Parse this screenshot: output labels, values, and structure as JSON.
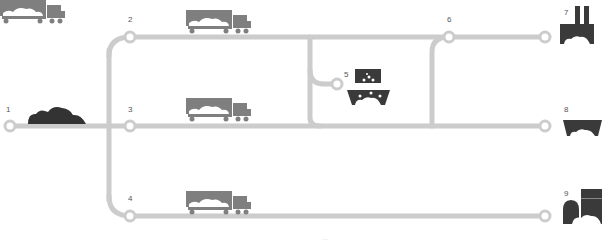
{
  "diagram": {
    "type": "flow",
    "colors": {
      "line": "#cccccc",
      "icon": "#3a3a3a",
      "truck": "#7f7f7f",
      "label": "#555555"
    },
    "nodes": [
      {
        "id": "1",
        "label": "1",
        "icon": "ore-pile-icon"
      },
      {
        "id": "2",
        "label": "2",
        "icon": "truck-icon"
      },
      {
        "id": "3",
        "label": "3",
        "icon": "truck-icon"
      },
      {
        "id": "4",
        "label": "4",
        "icon": "truck-icon"
      },
      {
        "id": "5",
        "label": "5",
        "icon": "washing-plant-icon"
      },
      {
        "id": "6",
        "label": "6"
      },
      {
        "id": "7",
        "label": "7",
        "icon": "factory-icon"
      },
      {
        "id": "8",
        "label": "8",
        "icon": "container-icon"
      },
      {
        "id": "9",
        "label": "9",
        "icon": "storage-plant-icon"
      }
    ],
    "caption": "..."
  }
}
